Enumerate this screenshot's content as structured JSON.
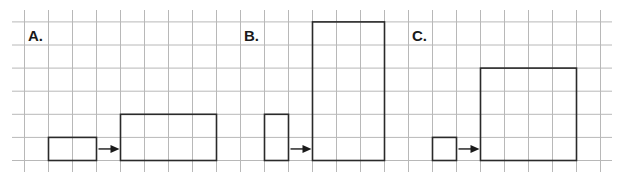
{
  "figure": {
    "grid": {
      "columns": 25,
      "rows": 7,
      "line_color": "#b8b8b8",
      "shape_color": "#2a2a2a"
    },
    "panels": [
      {
        "label": "A.",
        "original": {
          "width_units": 2,
          "height_units": 1
        },
        "transformed": {
          "width_units": 4,
          "height_units": 2
        }
      },
      {
        "label": "B.",
        "original": {
          "width_units": 1,
          "height_units": 2
        },
        "transformed": {
          "width_units": 3,
          "height_units": 6
        }
      },
      {
        "label": "C.",
        "original": {
          "width_units": 1,
          "height_units": 1
        },
        "transformed": {
          "width_units": 4,
          "height_units": 4
        }
      }
    ]
  }
}
